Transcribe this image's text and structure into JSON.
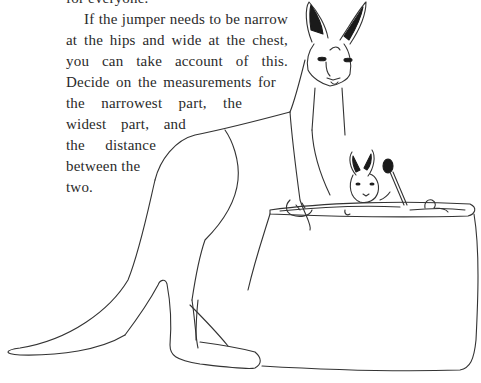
{
  "document": {
    "paragraph_lines": [
      "for everyone.",
      "If the jumper needs to be narrow",
      "at the hips and wide at the chest,",
      "you can take account of this.",
      "Decide on the measurements for",
      "the narrowest part, the",
      "widest part, and",
      "the distance",
      "between the",
      "two."
    ]
  },
  "illustration": {
    "subject": "kangaroo with joey in knitting-bag pouch",
    "elements": [
      "kangaroo",
      "joey",
      "rattle",
      "duck-toy",
      "pouch-bag"
    ]
  }
}
